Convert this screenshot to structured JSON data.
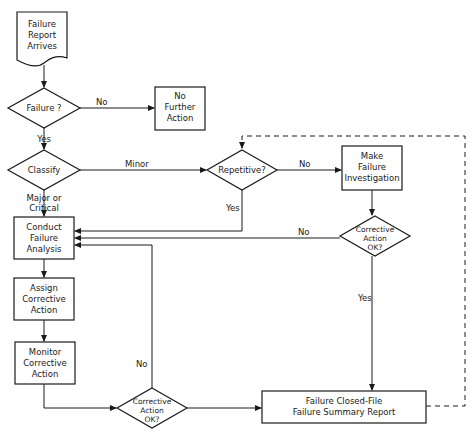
{
  "diagram": {
    "type": "flowchart",
    "nodes": {
      "start": {
        "shape": "document",
        "lines": [
          "Failure",
          "Report",
          "Arrives"
        ]
      },
      "failure_check": {
        "shape": "diamond",
        "label": "Failure ?"
      },
      "no_action": {
        "shape": "box",
        "lines": [
          "No",
          "Further",
          "Action"
        ]
      },
      "classify": {
        "shape": "diamond",
        "label": "Classify"
      },
      "repetitive": {
        "shape": "diamond",
        "label": "Repetitive?"
      },
      "investigate": {
        "shape": "box",
        "lines": [
          "Make",
          "Failure",
          "Investigation"
        ]
      },
      "ca_ok_right": {
        "shape": "diamond",
        "lines": [
          "Corrective",
          "Action",
          "OK?"
        ]
      },
      "conduct": {
        "shape": "box",
        "lines": [
          "Conduct",
          "Failure",
          "Analysis"
        ]
      },
      "assign": {
        "shape": "box",
        "lines": [
          "Assign",
          "Corrective",
          "Action"
        ]
      },
      "monitor": {
        "shape": "box",
        "lines": [
          "Monitor",
          "Corrective",
          "Action"
        ]
      },
      "ca_ok_bottom": {
        "shape": "diamond",
        "lines": [
          "Corrective",
          "Action",
          "OK?"
        ]
      },
      "closed": {
        "shape": "box",
        "lines": [
          "Failure Closed-File",
          "Failure Summary Report"
        ]
      }
    },
    "edge_labels": {
      "failure_no": "No",
      "failure_yes": "Yes",
      "classify_minor": "Minor",
      "classify_major_1": "Major or",
      "classify_major_2": "Critical",
      "repetitive_no": "No",
      "repetitive_yes": "Yes",
      "ca_right_no": "No",
      "ca_right_yes": "Yes",
      "ca_bottom_no": "No"
    }
  }
}
